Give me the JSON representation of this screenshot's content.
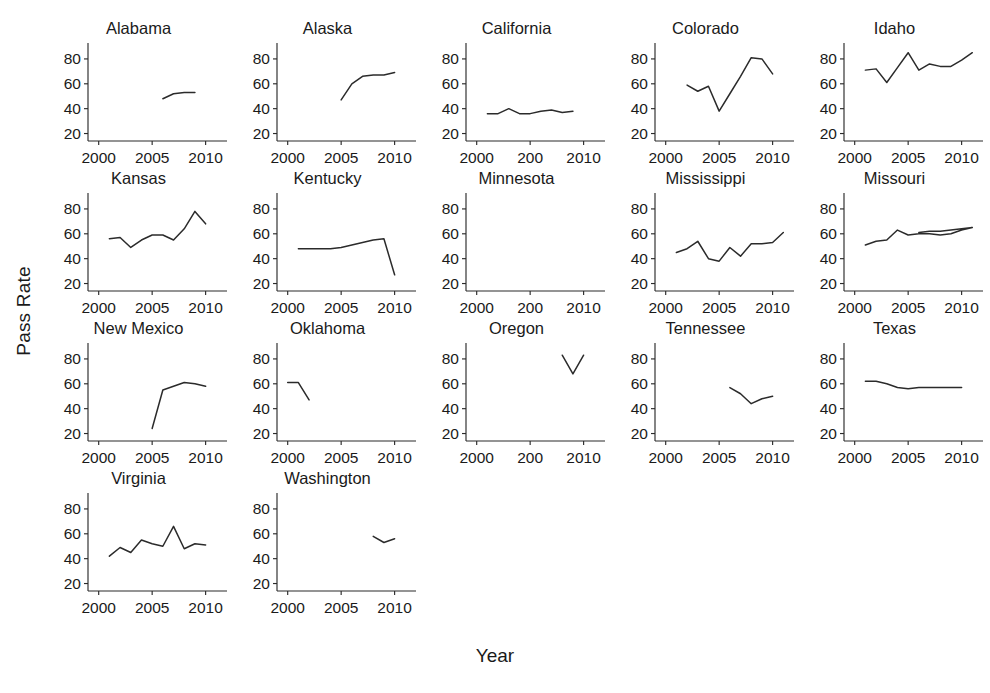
{
  "chart_data": {
    "type": "line",
    "title": "",
    "xlabel": "Year",
    "ylabel": "Pass Rate",
    "xlim": [
      1999,
      2012
    ],
    "ylim": [
      14,
      92
    ],
    "yticks": [
      20,
      40,
      60,
      80
    ],
    "grid": false,
    "legend": "none",
    "layout": "small-multiples",
    "panels_per_row": 5,
    "panels": [
      {
        "name": "Alabama",
        "xticks": [
          2000,
          2005,
          2010
        ],
        "xticklabels": [
          "2000",
          "2005",
          "2010"
        ],
        "x": [
          2006,
          2007,
          2008,
          2009
        ],
        "y": [
          48,
          52,
          53,
          53
        ]
      },
      {
        "name": "Alaska",
        "xticks": [
          2000,
          2005,
          2010
        ],
        "xticklabels": [
          "2000",
          "2005",
          "2010"
        ],
        "x": [
          2005,
          2006,
          2007,
          2008,
          2009,
          2010
        ],
        "y": [
          47,
          60,
          66,
          67,
          67,
          69
        ]
      },
      {
        "name": "California",
        "xticks": [
          2000,
          2005,
          2010
        ],
        "xticklabels": [
          "2000",
          "200",
          "2010"
        ],
        "x": [
          2001,
          2002,
          2003,
          2004,
          2005,
          2006,
          2007,
          2008,
          2009
        ],
        "y": [
          36,
          36,
          40,
          36,
          36,
          38,
          39,
          37,
          38
        ]
      },
      {
        "name": "Colorado",
        "xticks": [
          2000,
          2005,
          2010
        ],
        "xticklabels": [
          "2000",
          "2005",
          "2010"
        ],
        "x": [
          2002,
          2003,
          2004,
          2005,
          2006,
          2007,
          2008,
          2009,
          2010
        ],
        "y": [
          59,
          54,
          58,
          38,
          52,
          66,
          81,
          80,
          68
        ]
      },
      {
        "name": "Idaho",
        "xticks": [
          2000,
          2005,
          2010
        ],
        "xticklabels": [
          "2000",
          "2005",
          "2010"
        ],
        "x": [
          2001,
          2002,
          2003,
          2004,
          2005,
          2006,
          2007,
          2008,
          2009,
          2010,
          2011
        ],
        "y": [
          71,
          72,
          61,
          73,
          85,
          71,
          76,
          74,
          74,
          79,
          85
        ]
      },
      {
        "name": "Kansas",
        "xticks": [
          2000,
          2005,
          2010
        ],
        "xticklabels": [
          "2000",
          "2005",
          "2010"
        ],
        "x": [
          2001,
          2002,
          2003,
          2004,
          2005,
          2006,
          2007,
          2008,
          2009,
          2010
        ],
        "y": [
          56,
          57,
          49,
          55,
          59,
          59,
          55,
          64,
          78,
          68
        ]
      },
      {
        "name": "Kentucky",
        "xticks": [
          2000,
          2005,
          2010
        ],
        "xticklabels": [
          "2000",
          "2005",
          "2010"
        ],
        "x": [
          2001,
          2002,
          2003,
          2004,
          2005,
          2006,
          2007,
          2008,
          2009,
          2010
        ],
        "y": [
          48,
          48,
          48,
          48,
          49,
          51,
          53,
          55,
          56,
          27
        ]
      },
      {
        "name": "Minnesota",
        "xticks": [
          2000,
          2005,
          2010
        ],
        "xticklabels": [
          "2000",
          "200",
          "2010"
        ],
        "x": [],
        "y": []
      },
      {
        "name": "Mississippi",
        "xticks": [
          2000,
          2005,
          2010
        ],
        "xticklabels": [
          "2000",
          "2005",
          "2010"
        ],
        "x": [
          2001,
          2002,
          2003,
          2004,
          2005,
          2006,
          2007,
          2008,
          2009,
          2010,
          2011
        ],
        "y": [
          45,
          48,
          54,
          40,
          38,
          49,
          42,
          52,
          52,
          53,
          61
        ]
      },
      {
        "name": "Missouri",
        "xticks": [
          2000,
          2005,
          2010
        ],
        "xticklabels": [
          "2000",
          "2005",
          "2010"
        ],
        "x": [
          2001,
          2002,
          2003,
          2004,
          2005,
          2006,
          2007,
          2008,
          2009,
          2010,
          2011,
          2010,
          2009,
          2008,
          2007,
          2006
        ],
        "y": [
          51,
          54,
          55,
          63,
          59,
          60,
          60,
          59,
          60,
          63,
          65,
          64,
          63,
          62,
          62,
          61
        ]
      },
      {
        "name": "New Mexico",
        "xticks": [
          2000,
          2005,
          2010
        ],
        "xticklabels": [
          "2000",
          "2005",
          "2010"
        ],
        "x": [
          2005,
          2006,
          2007,
          2008,
          2009,
          2010
        ],
        "y": [
          24,
          55,
          58,
          61,
          60,
          58
        ]
      },
      {
        "name": "Oklahoma",
        "xticks": [
          2000,
          2005,
          2010
        ],
        "xticklabels": [
          "2000",
          "2005",
          "2010"
        ],
        "x": [
          2000,
          2001,
          2002
        ],
        "y": [
          61,
          61,
          47
        ]
      },
      {
        "name": "Oregon",
        "xticks": [
          2000,
          2005,
          2010
        ],
        "xticklabels": [
          "2000",
          "200",
          "2010"
        ],
        "x": [
          2008,
          2009,
          2010
        ],
        "y": [
          83,
          68,
          83
        ]
      },
      {
        "name": "Tennessee",
        "xticks": [
          2000,
          2005,
          2010
        ],
        "xticklabels": [
          "2000",
          "2005",
          "2010"
        ],
        "x": [
          2006,
          2007,
          2008,
          2009,
          2010
        ],
        "y": [
          57,
          52,
          44,
          48,
          50
        ]
      },
      {
        "name": "Texas",
        "xticks": [
          2000,
          2005,
          2010
        ],
        "xticklabels": [
          "2000",
          "2005",
          "2010"
        ],
        "x": [
          2001,
          2002,
          2003,
          2004,
          2005,
          2006,
          2007,
          2008,
          2009,
          2010
        ],
        "y": [
          62,
          62,
          60,
          57,
          56,
          57,
          57,
          57,
          57,
          57
        ]
      },
      {
        "name": "Virginia",
        "xticks": [
          2000,
          2005,
          2010
        ],
        "xticklabels": [
          "2000",
          "2005",
          "2010"
        ],
        "x": [
          2001,
          2002,
          2003,
          2004,
          2005,
          2006,
          2007,
          2008,
          2009,
          2010
        ],
        "y": [
          42,
          49,
          45,
          55,
          52,
          50,
          66,
          48,
          52,
          51
        ]
      },
      {
        "name": "Washington",
        "xticks": [
          2000,
          2005,
          2010
        ],
        "xticklabels": [
          "2000",
          "2005",
          "2010"
        ],
        "x": [
          2008,
          2009,
          2010
        ],
        "y": [
          58,
          53,
          56
        ]
      }
    ],
    "colors": {
      "line": "#2b2b2b",
      "axis": "#2b2b2b",
      "text": "#1a1a1a",
      "background": "#ffffff"
    }
  }
}
